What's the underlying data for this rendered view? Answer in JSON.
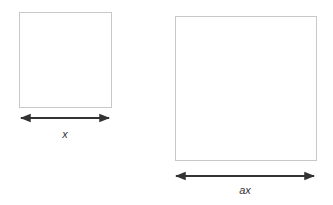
{
  "diagram": {
    "small_square": {
      "x": 19,
      "y": 12,
      "w": 92,
      "h": 95,
      "stroke": "#c8c8c8"
    },
    "large_square": {
      "x": 175,
      "y": 16,
      "w": 141,
      "h": 144,
      "stroke": "#c8c8c8"
    },
    "small_arrow": {
      "x1": 19,
      "x2": 111,
      "y": 118,
      "color": "#333333"
    },
    "large_arrow": {
      "x1": 174,
      "x2": 316,
      "y": 176,
      "color": "#333333"
    },
    "small_label": "x",
    "large_label": "ax"
  }
}
